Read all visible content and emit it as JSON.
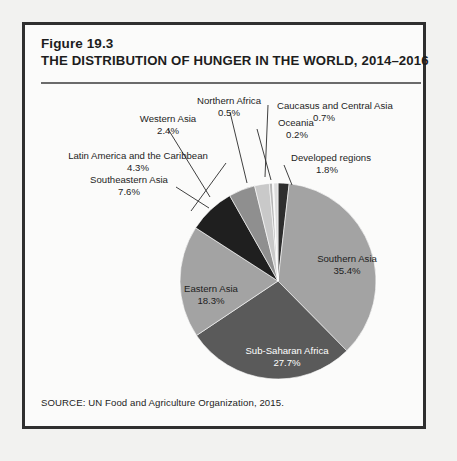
{
  "figure": {
    "number": "Figure 19.3",
    "title": "THE DISTRIBUTION OF HUNGER IN THE WORLD, 2014–2016",
    "source": "SOURCE: UN Food and Agriculture Organization, 2015."
  },
  "chart_data": {
    "type": "pie",
    "title": "THE DISTRIBUTION OF HUNGER IN THE WORLD, 2014–2016",
    "unit": "percent",
    "total": 100.0,
    "start_angle_deg": 0,
    "direction": "clockwise",
    "legend": "none",
    "categories": [
      "Developed regions",
      "Southern Asia",
      "Sub-Saharan Africa",
      "Eastern Asia",
      "Southeastern Asia",
      "Latin America and the Caribbean",
      "Western Asia",
      "Northern Africa",
      "Oceania",
      "Caucasus and Central Asia"
    ],
    "values": [
      1.8,
      35.4,
      27.7,
      18.3,
      7.6,
      4.3,
      2.4,
      0.5,
      0.2,
      0.7
    ],
    "colors": [
      "#2e2e2e",
      "#a3a3a3",
      "#5a5a5a",
      "#a3a3a3",
      "#1f1f1f",
      "#8f8f8f",
      "#c9c9c9",
      "#b5b5b5",
      "#ededed",
      "#dcdcdc"
    ],
    "slices": [
      {
        "name": "Developed regions",
        "value": 1.8,
        "label": "Developed regions",
        "value_label": "1.8%",
        "color": "#2e2e2e",
        "label_placement": "callout"
      },
      {
        "name": "Southern Asia",
        "value": 35.4,
        "label": "Southern Asia",
        "value_label": "35.4%",
        "color": "#a3a3a3",
        "label_placement": "inside"
      },
      {
        "name": "Sub-Saharan Africa",
        "value": 27.7,
        "label": "Sub-Saharan Africa",
        "value_label": "27.7%",
        "color": "#5a5a5a",
        "label_placement": "inside"
      },
      {
        "name": "Eastern Asia",
        "value": 18.3,
        "label": "Eastern Asia",
        "value_label": "18.3%",
        "color": "#a3a3a3",
        "label_placement": "inside"
      },
      {
        "name": "Southeastern Asia",
        "value": 7.6,
        "label": "Southeastern Asia",
        "value_label": "7.6%",
        "color": "#1f1f1f",
        "label_placement": "callout"
      },
      {
        "name": "Latin America and the Caribbean",
        "value": 4.3,
        "label": "Latin America and the Caribbean",
        "value_label": "4.3%",
        "color": "#8f8f8f",
        "label_placement": "callout"
      },
      {
        "name": "Western Asia",
        "value": 2.4,
        "label": "Western Asia",
        "value_label": "2.4%",
        "color": "#c9c9c9",
        "label_placement": "callout"
      },
      {
        "name": "Northern Africa",
        "value": 0.5,
        "label": "Northern Africa",
        "value_label": "0.5%",
        "color": "#b5b5b5",
        "label_placement": "callout"
      },
      {
        "name": "Oceania",
        "value": 0.2,
        "label": "Oceania",
        "value_label": "0.2%",
        "color": "#ededed",
        "label_placement": "callout"
      },
      {
        "name": "Caucasus and Central Asia",
        "value": 0.7,
        "label": "Caucasus and Central Asia",
        "value_label": "0.7%",
        "color": "#dcdcdc",
        "label_placement": "callout"
      }
    ]
  },
  "labels": {
    "southern_asia": {
      "name": "Southern Asia",
      "pct": "35.4%"
    },
    "sub_saharan_africa": {
      "name": "Sub-Saharan Africa",
      "pct": "27.7%"
    },
    "eastern_asia": {
      "name": "Eastern Asia",
      "pct": "18.3%"
    },
    "southeastern_asia": {
      "name": "Southeastern Asia",
      "pct": "7.6%"
    },
    "latin_america": {
      "name": "Latin America and the Caribbean",
      "pct": "4.3%"
    },
    "western_asia": {
      "name": "Western Asia",
      "pct": "2.4%"
    },
    "northern_africa": {
      "name": "Northern Africa",
      "pct": "0.5%"
    },
    "oceania": {
      "name": "Oceania",
      "pct": "0.2%"
    },
    "caucasus": {
      "name": "Caucasus and Central Asia",
      "pct": "0.7%"
    },
    "developed_regions": {
      "name": "Developed regions",
      "pct": "1.8%"
    }
  }
}
